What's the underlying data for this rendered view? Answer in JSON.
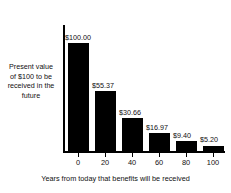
{
  "chart_data": {
    "type": "bar",
    "title": "",
    "subtitle": "",
    "xlabel": "Years from today that benefits will be received",
    "ylabel": "Present value of $100 to be received in the future",
    "categories": [
      "0",
      "20",
      "40",
      "60",
      "80",
      "100"
    ],
    "values": [
      100.0,
      55.37,
      30.66,
      16.97,
      9.4,
      5.2
    ],
    "data_labels": [
      "$100.00",
      "$55.37",
      "$30.66",
      "$16.97",
      "$9.40",
      "$5.20"
    ],
    "xlim": [
      -10,
      110
    ],
    "ylim": [
      0,
      100
    ],
    "grid": false,
    "legend": false,
    "bar_color": "#000000",
    "background_color": "#ffffff",
    "text_color": "#111111"
  },
  "axes": {
    "y_caption_lines": "Present value\nof $100 to be\nreceived in the\nfuture",
    "x_title": "Years from today that benefits will be received",
    "x_tick_labels": [
      "0",
      "20",
      "40",
      "60",
      "80",
      "100"
    ]
  },
  "bars": [
    {
      "label": "$100.00",
      "value": 100.0,
      "year": "0"
    },
    {
      "label": "$55.37",
      "value": 55.37,
      "year": "20"
    },
    {
      "label": "$30.66",
      "value": 30.66,
      "year": "40"
    },
    {
      "label": "$16.97",
      "value": 16.97,
      "year": "60"
    },
    {
      "label": "$9.40",
      "value": 9.4,
      "year": "80"
    },
    {
      "label": "$5.20",
      "value": 5.2,
      "year": "100"
    }
  ]
}
